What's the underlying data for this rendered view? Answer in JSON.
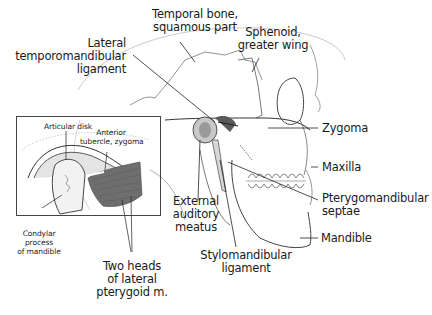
{
  "figure": {
    "labels": {
      "temporal_bone": [
        "Temporal bone,",
        "squamous part"
      ],
      "sphenoid": [
        "Sphenoid,",
        "greater wing"
      ],
      "lateral_tm_ligament": [
        "Lateral",
        "temporomandibular",
        "ligament"
      ],
      "zygoma": [
        "Zygoma"
      ],
      "maxilla": [
        "Maxilla"
      ],
      "pterygomandibular": [
        "Pterygomandibular",
        "septae"
      ],
      "mandible": [
        "Mandible"
      ],
      "external_auditory": [
        "External",
        "auditory",
        "meatus"
      ],
      "stylomandibular": [
        "Stylomandibular",
        "ligament"
      ],
      "two_heads": [
        "Two heads",
        "of lateral",
        "pterygoid m."
      ]
    },
    "inset": {
      "labels": {
        "articular_disk": [
          "Articular disk"
        ],
        "anterior_tubercle": [
          "Anterior",
          "tubercle, zygoma"
        ],
        "condylar_process": [
          "Condylar",
          "process",
          "of mandible"
        ]
      }
    },
    "colors": {
      "ink": "#1a1a1a",
      "line": "#333333",
      "shade": "#7a7a7a",
      "muscle": "#6e6e6e",
      "background": "#ffffff"
    }
  }
}
